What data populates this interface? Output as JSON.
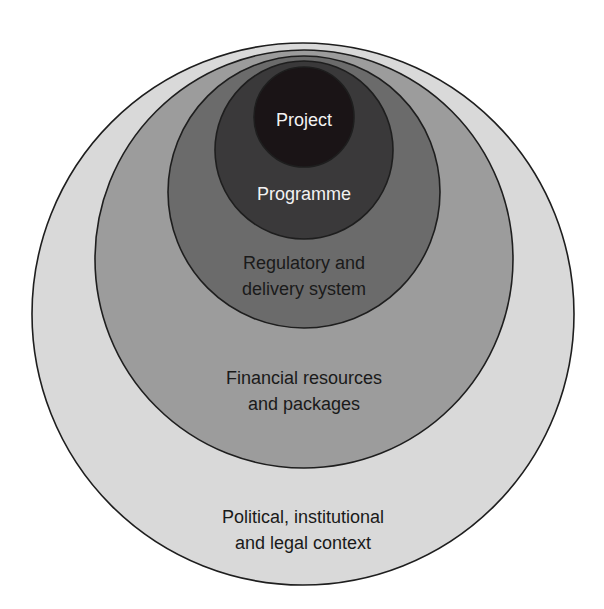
{
  "diagram": {
    "type": "nested-circles",
    "colors": {
      "outline": "#1e1e1e",
      "background": "#ffffff"
    },
    "layers": [
      {
        "id": "political",
        "lines": [
          "Political, institutional",
          "and legal context"
        ],
        "fill": "#d9d9d9",
        "text_color": "#1a1a1a",
        "circle": {
          "cx": 303,
          "cy": 314,
          "r": 271
        },
        "text_y": [
          523,
          549
        ]
      },
      {
        "id": "financial",
        "lines": [
          "Financial resources",
          "and packages"
        ],
        "fill": "#9c9c9c",
        "text_color": "#1a1a1a",
        "circle": {
          "cx": 304,
          "cy": 259,
          "r": 209
        },
        "text_y": [
          384,
          410
        ]
      },
      {
        "id": "regulatory",
        "lines": [
          "Regulatory and",
          "delivery system"
        ],
        "fill": "#6b6b6b",
        "text_color": "#1a1a1a",
        "circle": {
          "cx": 304,
          "cy": 192,
          "r": 136
        },
        "text_y": [
          269,
          295
        ]
      },
      {
        "id": "programme",
        "lines": [
          "Programme"
        ],
        "fill": "#3a393a",
        "text_color": "#f2f2f2",
        "circle": {
          "cx": 304,
          "cy": 150,
          "r": 89
        },
        "text_y": [
          200
        ]
      },
      {
        "id": "project",
        "lines": [
          "Project"
        ],
        "fill": "#1a1416",
        "text_color": "#f2f2f2",
        "circle": {
          "cx": 304,
          "cy": 117,
          "r": 50
        },
        "text_y": [
          126
        ]
      }
    ]
  }
}
